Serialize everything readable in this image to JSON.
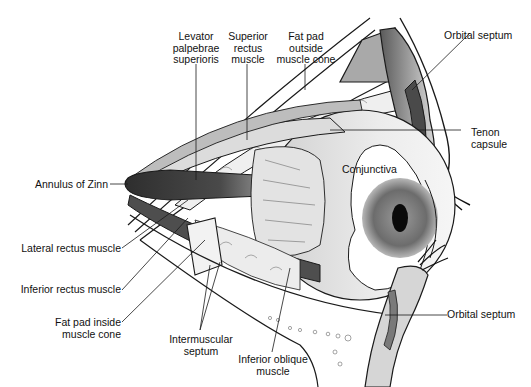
{
  "diagram": {
    "colors": {
      "background": "#ffffff",
      "outline": "#1a1a1a",
      "muscle_dark": "#3a3a3a",
      "muscle_mid": "#6e6e6e",
      "tissue_light": "#e6e6e6",
      "tissue_mid": "#c4c4c4",
      "iris": "#7a7a7a",
      "pupil": "#0a0a0a"
    },
    "labels": {
      "levator": "Levator\npalpebrae\nsuperioris",
      "superior_rectus": "Superior\nrectus\nmuscle",
      "fat_pad_outside": "Fat pad\noutside\nmuscle cone",
      "orbital_septum_top": "Orbital septum",
      "tenon": "Tenon\ncapsule",
      "conjunctiva": "Conjunctiva",
      "annulus": "Annulus of Zinn",
      "lateral_rectus": "Lateral rectus muscle",
      "inferior_rectus": "Inferior rectus muscle",
      "fat_pad_inside": "Fat pad inside\nmuscle cone",
      "intermuscular": "Intermuscular\nseptum",
      "inferior_oblique": "Inferior oblique\nmuscle",
      "orbital_septum_bottom": "Orbital septum"
    }
  }
}
